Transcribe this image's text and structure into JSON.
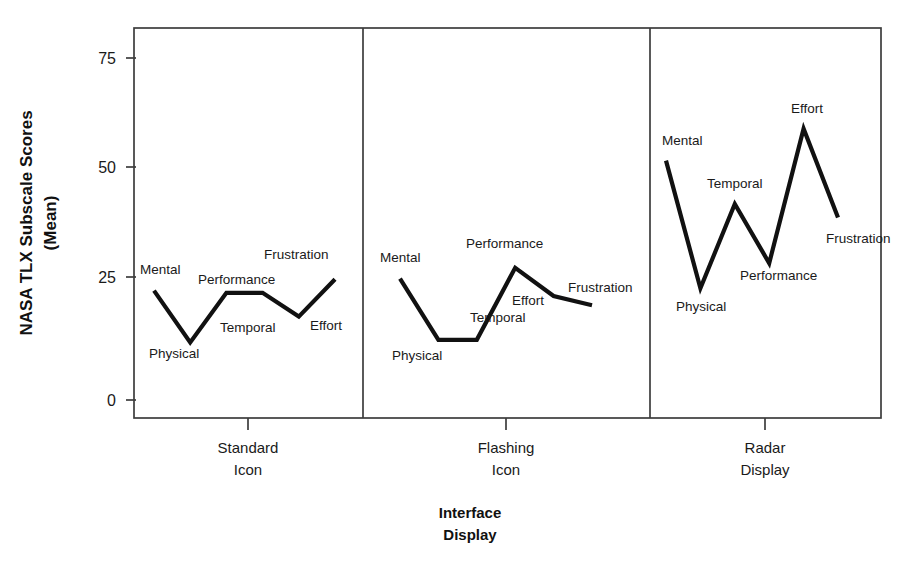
{
  "chart_data": {
    "type": "line",
    "title": "",
    "xlabel": "Interface Display",
    "ylabel": "NASA TLX Subscale Scores (Mean)",
    "ylim": [
      0,
      82
    ],
    "yticks": [
      0,
      25,
      50,
      75
    ],
    "ytick_labels": [
      "0",
      "25",
      "50",
      "75"
    ],
    "grid": false,
    "legend": "none",
    "categories": [
      "Mental",
      "Physical",
      "Temporal",
      "Performance",
      "Effort",
      "Frustration"
    ],
    "panels": [
      {
        "name": "Standard Icon",
        "label_line1": "Standard",
        "label_line2": "Icon",
        "points": [
          {
            "label": "Mental",
            "value": 24.0
          },
          {
            "label": "Physical",
            "value": 12.6
          },
          {
            "label": "Temporal",
            "value": 23.5
          },
          {
            "label": "Performance",
            "value": 23.5
          },
          {
            "label": "Effort",
            "value": 18.3
          },
          {
            "label": "Frustration",
            "value": 26.5
          }
        ]
      },
      {
        "name": "Flashing Icon",
        "label_line1": "Flashing",
        "label_line2": "Icon",
        "points": [
          {
            "label": "Mental",
            "value": 26.6
          },
          {
            "label": "Physical",
            "value": 13.2
          },
          {
            "label": "Temporal",
            "value": 13.2
          },
          {
            "label": "Performance",
            "value": 29.0
          },
          {
            "label": "Effort",
            "value": 22.8
          },
          {
            "label": "Frustration",
            "value": 20.8
          }
        ]
      },
      {
        "name": "Radar Display",
        "label_line1": "Radar",
        "label_line2": "Display",
        "points": [
          {
            "label": "Mental",
            "value": 52.5
          },
          {
            "label": "Physical",
            "value": 24.5
          },
          {
            "label": "Temporal",
            "value": 43.0
          },
          {
            "label": "Performance",
            "value": 30.0
          },
          {
            "label": "Effort",
            "value": 59.5
          },
          {
            "label": "Frustration",
            "value": 40.0
          }
        ]
      }
    ],
    "series_color": "#111111",
    "axis_color": "#3d3d3d",
    "background_color": "#ffffff"
  },
  "axes": {
    "y_title": "NASA TLX Subscale Scores",
    "y_title_line2": "(Mean)",
    "x_title_line1": "Interface",
    "x_title_line2": "Display",
    "ytick_0": "0",
    "ytick_25": "25",
    "ytick_50": "50",
    "ytick_75": "75"
  },
  "panel_labels": {
    "p1_line1": "Standard",
    "p1_line2": "Icon",
    "p2_line1": "Flashing",
    "p2_line2": "Icon",
    "p3_line1": "Radar",
    "p3_line2": "Display"
  },
  "point_labels": {
    "p1": {
      "mental": "Mental",
      "physical": "Physical",
      "temporal": "Temporal",
      "performance": "Performance",
      "effort": "Effort",
      "frustration": "Frustration"
    },
    "p2": {
      "mental": "Mental",
      "physical": "Physical",
      "temporal": "Temporal",
      "performance": "Performance",
      "effort": "Effort",
      "frustration": "Frustration"
    },
    "p3": {
      "mental": "Mental",
      "physical": "Physical",
      "temporal": "Temporal",
      "performance": "Performance",
      "effort": "Effort",
      "frustration": "Frustration"
    }
  }
}
